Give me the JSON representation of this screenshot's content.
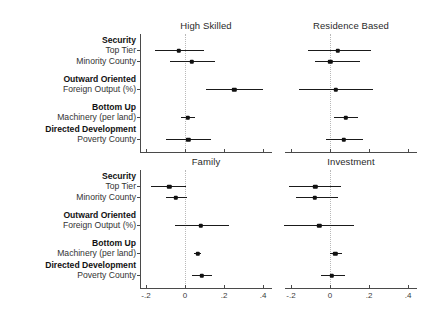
{
  "chart_data": {
    "type": "scatter",
    "title": "",
    "subtitle": "",
    "xlabel": "",
    "ylabel": "",
    "xlim": [
      -0.3,
      0.45
    ],
    "xticks": [
      -0.2,
      0,
      0.2,
      0.4
    ],
    "xticklabels": [
      "-.2",
      "0",
      ".2",
      ".4"
    ],
    "grid": false,
    "legend": null,
    "zero_reference_line": 0,
    "annotation": "Coefficient plot with 95% confidence intervals; four outcome panels share common predictors.",
    "categories": [
      {
        "group": "Security",
        "label": "Top Tier"
      },
      {
        "group": "",
        "label": "Minority County"
      },
      {
        "group": "Outward Oriented",
        "label": "Foreign Output (%)"
      },
      {
        "group": "Bottom Up",
        "label": "Machinery (per land)"
      },
      {
        "group": "Directed Development",
        "label": "Poverty County"
      }
    ],
    "panels": [
      {
        "name": "High Skilled",
        "row": 0,
        "col": 0,
        "points": [
          {
            "label": "Top Tier",
            "estimate": -0.032,
            "ci_low": -0.155,
            "ci_high": 0.098
          },
          {
            "label": "Minority County",
            "estimate": 0.035,
            "ci_low": -0.078,
            "ci_high": 0.152
          },
          {
            "label": "Foreign Output (%)",
            "estimate": 0.252,
            "ci_low": 0.108,
            "ci_high": 0.398
          },
          {
            "label": "Machinery (per land)",
            "estimate": 0.014,
            "ci_low": -0.022,
            "ci_high": 0.05
          },
          {
            "label": "Poverty County",
            "estimate": 0.016,
            "ci_low": -0.098,
            "ci_high": 0.132
          }
        ]
      },
      {
        "name": "Residence Based",
        "row": 0,
        "col": 1,
        "points": [
          {
            "label": "Top Tier",
            "estimate": 0.04,
            "ci_low": -0.112,
            "ci_high": 0.212
          },
          {
            "label": "Minority County",
            "estimate": 0.002,
            "ci_low": -0.078,
            "ci_high": 0.152
          },
          {
            "label": "Foreign Output (%)",
            "estimate": 0.03,
            "ci_low": -0.158,
            "ci_high": 0.218
          },
          {
            "label": "Machinery (per land)",
            "estimate": 0.08,
            "ci_low": 0.02,
            "ci_high": 0.142
          },
          {
            "label": "Poverty County",
            "estimate": 0.07,
            "ci_low": -0.022,
            "ci_high": 0.17
          }
        ]
      },
      {
        "name": "Family",
        "row": 1,
        "col": 0,
        "points": [
          {
            "label": "Top Tier",
            "estimate": -0.08,
            "ci_low": -0.175,
            "ci_high": 0.005
          },
          {
            "label": "Minority County",
            "estimate": -0.046,
            "ci_low": -0.1,
            "ci_high": 0.008
          },
          {
            "label": "Foreign Output (%)",
            "estimate": 0.08,
            "ci_low": -0.05,
            "ci_high": 0.225
          },
          {
            "label": "Machinery (per land)",
            "estimate": 0.065,
            "ci_low": 0.048,
            "ci_high": 0.082
          },
          {
            "label": "Poverty County",
            "estimate": 0.085,
            "ci_low": 0.035,
            "ci_high": 0.14
          }
        ]
      },
      {
        "name": "Investment",
        "row": 1,
        "col": 1,
        "points": [
          {
            "label": "Top Tier",
            "estimate": -0.075,
            "ci_low": -0.212,
            "ci_high": 0.055
          },
          {
            "label": "Minority County",
            "estimate": -0.078,
            "ci_low": -0.175,
            "ci_high": 0.04
          },
          {
            "label": "Foreign Output (%)",
            "estimate": -0.055,
            "ci_low": -0.235,
            "ci_high": 0.122
          },
          {
            "label": "Machinery (per land)",
            "estimate": 0.028,
            "ci_low": 0.0,
            "ci_high": 0.06
          },
          {
            "label": "Poverty County",
            "estimate": 0.01,
            "ci_low": -0.048,
            "ci_high": 0.075
          }
        ]
      }
    ]
  },
  "axis_colors": {
    "axis": "#4a4a4a",
    "point": "#111111",
    "interval": "#1a1a1a",
    "zero_line": "#b9b9b9"
  }
}
